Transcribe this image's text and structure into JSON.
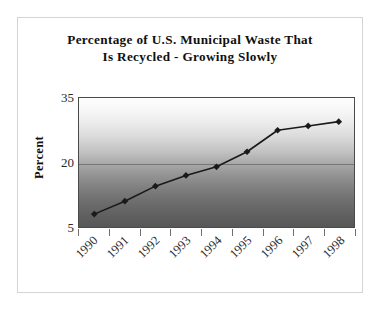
{
  "chart_data": {
    "type": "line",
    "title": "Percentage of U.S. Municipal Waste That\nIs Recycled - Growing Slowly",
    "title_line1": "Percentage of U.S. Municipal Waste That",
    "title_line2": "Is Recycled - Growing Slowly",
    "xlabel": "",
    "ylabel": "Percent",
    "categories": [
      "1990",
      "1991",
      "1992",
      "1993",
      "1994",
      "1995",
      "1996",
      "1997",
      "1998"
    ],
    "values": [
      8,
      11,
      14.5,
      17,
      19,
      22.5,
      27.5,
      28.5,
      29.5
    ],
    "series": [
      {
        "name": "Percent recycled",
        "values": [
          8,
          11,
          14.5,
          17,
          19,
          22.5,
          27.5,
          28.5,
          29.5
        ]
      }
    ],
    "ylim": [
      5,
      35
    ],
    "yticks": [
      5,
      20,
      35
    ],
    "ytick_labels": [
      "5",
      "20",
      "35"
    ],
    "grid": true,
    "gridlines_y": [
      20
    ],
    "legend": false,
    "legend_position": "none",
    "marker": "diamond",
    "line_color": "#1a1a1a",
    "marker_color": "#1a1a1a",
    "plot_background": "vertical gradient white to dark gray",
    "plot_bg_top_color": "#fdfdfd",
    "plot_bg_bottom_color": "#575757",
    "axis_color": "#4a4a4a",
    "frame_color": "#d4d4d4",
    "text_color": "#101010"
  }
}
